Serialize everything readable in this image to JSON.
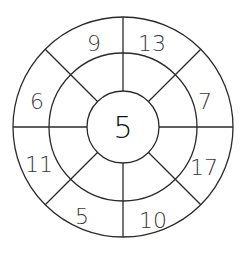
{
  "worksheet": {
    "type": "number-wheel",
    "center_value": "5",
    "outer_values": [
      {
        "position": "top-left",
        "value": "9"
      },
      {
        "position": "top-right",
        "value": "13"
      },
      {
        "position": "right-upper",
        "value": "7"
      },
      {
        "position": "right-lower",
        "value": "17"
      },
      {
        "position": "bottom-right",
        "value": "10"
      },
      {
        "position": "bottom-left",
        "value": "5"
      },
      {
        "position": "left-lower",
        "value": "11"
      },
      {
        "position": "left-upper",
        "value": "6"
      }
    ],
    "middle_ring_cells": [
      "",
      "",
      "",
      "",
      "",
      "",
      "",
      ""
    ],
    "colors": {
      "line": "#2a2a2a",
      "text": "#3a3a3a",
      "background": "#ffffff"
    }
  }
}
